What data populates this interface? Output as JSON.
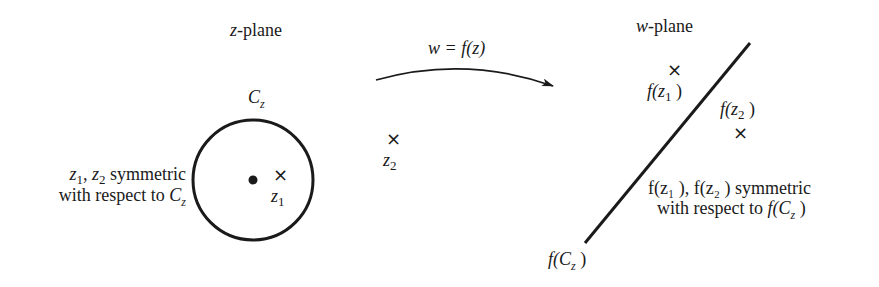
{
  "diagram": {
    "z_plane": {
      "title_var": "z",
      "title_rest": "-plane",
      "contour_label": "C",
      "contour_sub": "z",
      "point_z1": "z",
      "point_z1_sub": "1",
      "point_z2": "z",
      "point_z2_sub": "2",
      "marker": "×",
      "note_line1_a": "z",
      "note_line1_a_sub": "1",
      "note_line1_b": ", ",
      "note_line1_c": "z",
      "note_line1_c_sub": "2",
      "note_line1_d": " symmetric",
      "note_line2_a": "with respect to ",
      "note_line2_b": "C",
      "note_line2_b_sub": "z"
    },
    "mapping": {
      "label": "w = f(z)"
    },
    "w_plane": {
      "title_var": "w",
      "title_rest": "-plane",
      "marker": "×",
      "fz1_a": "f",
      "fz1_b": "(z",
      "fz1_sub": "1",
      "fz1_c": " )",
      "fz2_a": "f",
      "fz2_b": "(z",
      "fz2_sub": "2",
      "fz2_c": " )",
      "line_label_a": "f",
      "line_label_b": "(C",
      "line_label_sub": "z",
      "line_label_c": " )",
      "note_line1": "f(z₁ ), f(z₂ ) symmetric",
      "note_line2_a": "with respect to ",
      "note_line2_b": "f",
      "note_line2_c": "(C",
      "note_line2_sub": "z",
      "note_line2_d": " )"
    }
  }
}
